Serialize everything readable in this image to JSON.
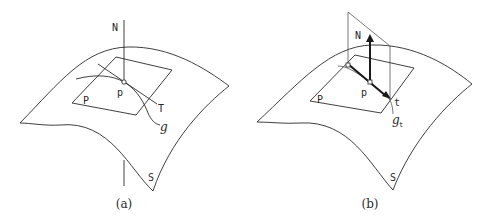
{
  "figure": {
    "panels": [
      {
        "id": "a",
        "caption": "(a)",
        "labels": {
          "normal": "N",
          "point": "p",
          "plane": "P",
          "tangent": "T",
          "curve": "g",
          "surface": "S"
        }
      },
      {
        "id": "b",
        "caption": "(b)",
        "labels": {
          "normal": "N",
          "point": "p",
          "plane": "P",
          "tangent": "t",
          "curve": "g",
          "curve_subscript": "t",
          "surface": "S"
        }
      }
    ],
    "colors": {
      "stroke": "#2a2a2a",
      "background": "#ffffff"
    }
  }
}
